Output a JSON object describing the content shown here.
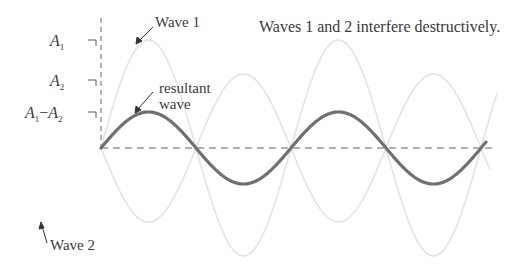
{
  "title": "Waves 1 and 2 interfere destructively.",
  "labels": {
    "wave1": "Wave 1",
    "wave2": "Wave 2",
    "resultant_line1": "resultant",
    "resultant_line2": "wave"
  },
  "axis_labels": {
    "a1": {
      "letter": "A",
      "sub": "1"
    },
    "a2": {
      "letter": "A",
      "sub": "2"
    },
    "diff": {
      "letter1": "A",
      "sub1": "1",
      "minus": "−",
      "letter2": "A",
      "sub2": "2"
    }
  },
  "colors": {
    "wave1": "#e3e3e3",
    "wave2": "#e3e3e3",
    "resultant": "#707070",
    "axis": "#666666",
    "text": "#3a3a3a"
  },
  "waves": {
    "origin_x": 101,
    "baseline_y": 148,
    "period_px": 190,
    "end_x": 486,
    "wave1_amplitude_px": 108,
    "wave2_amplitude_px": 74,
    "resultant_amplitude_px": 36
  }
}
